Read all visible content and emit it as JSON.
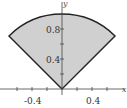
{
  "diagram": {
    "type": "polar-sector",
    "region": {
      "r_min": 0,
      "r_max": 1,
      "theta_min_deg": 45,
      "theta_max_deg": 135
    },
    "fill_color": "#d0d0d0",
    "edge_color": "#222222"
  },
  "axes": {
    "x_label": "x",
    "y_label": "y",
    "x_ticks": [
      {
        "value": -0.4,
        "label": "-0.4"
      },
      {
        "value": 0.4,
        "label": "0.4"
      }
    ],
    "y_ticks": [
      {
        "value": 0.4,
        "label": "0.4"
      },
      {
        "value": 0.8,
        "label": "0.8"
      }
    ]
  }
}
